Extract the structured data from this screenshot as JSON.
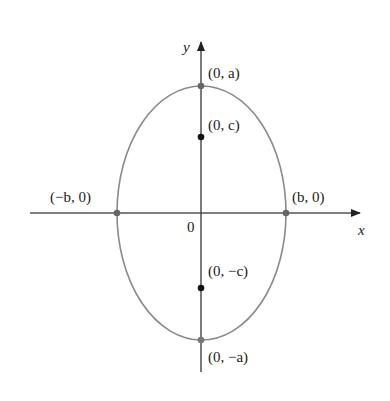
{
  "diagram": {
    "type": "ellipse-vertical-major-axis",
    "axes": {
      "x_label": "x",
      "y_label": "y",
      "origin_label": "0"
    },
    "points": [
      {
        "id": "vertex-top",
        "label": "(0, a)"
      },
      {
        "id": "focus-top",
        "label": "(0, c)"
      },
      {
        "id": "vertex-left",
        "label": "(−b, 0)"
      },
      {
        "id": "vertex-right",
        "label": "(b, 0)"
      },
      {
        "id": "focus-bottom",
        "label": "(0, −c)"
      },
      {
        "id": "vertex-bottom",
        "label": "(0, −a)"
      }
    ],
    "colors": {
      "ellipse": "#8a8a8a",
      "axis": "#3a3a3a",
      "focus": "#111111",
      "vertex": "#666666"
    }
  }
}
